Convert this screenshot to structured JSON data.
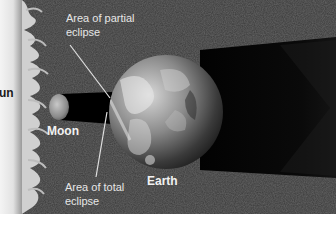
{
  "figure": {
    "labels": {
      "sun": "un",
      "moon": "Moon",
      "earth": "Earth",
      "partial_line1": "Area of partial",
      "partial_line2": "eclipse",
      "total_line1": "Area of total",
      "total_line2": "eclipse"
    },
    "colors": {
      "space": "#3a3a3a",
      "shadow": "#050505",
      "sun": "#e8e8e8",
      "label_text": "#f2f2f2",
      "leader_line": "#e0e0e0",
      "page_background": "#ffffff"
    }
  }
}
